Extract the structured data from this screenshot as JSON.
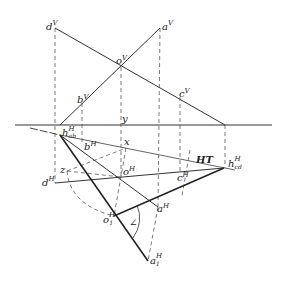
{
  "diagram": {
    "type": "descriptive-geometry-projection",
    "ground_line_label": "y",
    "trace_label": "HT",
    "angle_label": "∠",
    "points": {
      "dV": {
        "base": "d",
        "sup": "V"
      },
      "aV": {
        "base": "a",
        "sup": "V"
      },
      "oV": {
        "base": "o",
        "sup": "V"
      },
      "bV": {
        "base": "b",
        "sup": "V"
      },
      "cV": {
        "base": "c",
        "sup": "V"
      },
      "habH": {
        "base": "h",
        "sup": "H",
        "sub": "ab"
      },
      "bH": {
        "base": "b",
        "sup": "H"
      },
      "x": {
        "base": "x"
      },
      "oH": {
        "base": "o",
        "sup": "H"
      },
      "cH": {
        "base": "c",
        "sup": "H"
      },
      "hcdH": {
        "base": "h",
        "sup": "H",
        "sub": "cd"
      },
      "dH": {
        "base": "d",
        "sup": "H"
      },
      "z": {
        "base": "z"
      },
      "aH": {
        "base": "a",
        "sup": "H"
      },
      "o1H": {
        "base": "o",
        "sup": "H",
        "sub": "1"
      },
      "a1H": {
        "base": "a",
        "sup": "H",
        "sub": "1"
      }
    }
  }
}
